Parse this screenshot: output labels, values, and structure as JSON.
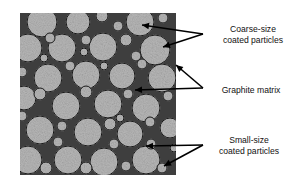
{
  "labels": {
    "coarse": {
      "line1": "Coarse-size",
      "line2": "coated particles"
    },
    "graphite": {
      "line1": "Graphite matrix"
    },
    "small": {
      "line1": "Small-size",
      "line2": "coated particles"
    }
  },
  "colors": {
    "matrix": "#3e3e3e",
    "particle_fill": "#b8b8b8",
    "particle_outline": "#1a1a1a",
    "arrow": "#000000",
    "text": "#111111"
  },
  "components": [
    {
      "name": "coarse-coated-particle",
      "count_shown": "many"
    },
    {
      "name": "graphite-matrix"
    },
    {
      "name": "small-coated-particle",
      "count_shown": "many"
    }
  ]
}
